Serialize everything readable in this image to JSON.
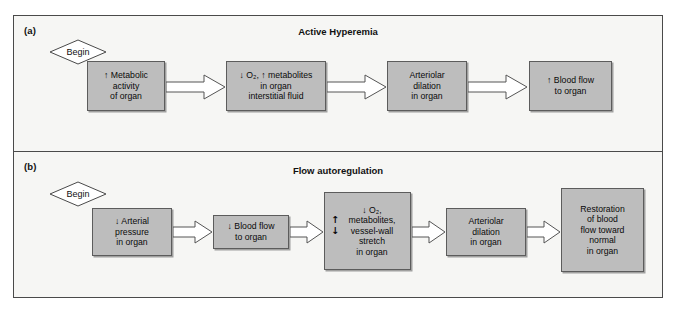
{
  "figure": {
    "panels": [
      {
        "key": "a",
        "label": "(a)",
        "title": "Active Hyperemia",
        "begin_label": "Begin",
        "steps": [
          {
            "name": "metabolic-activity",
            "lines": [
              "↑ Metabolic",
              "activity",
              "of organ"
            ]
          },
          {
            "name": "o2-metabolites",
            "lines": [
              "↓ O₂, ↑ metabolites",
              "in organ",
              "interstitial fluid"
            ]
          },
          {
            "name": "arteriolar-dilation",
            "lines": [
              "Arteriolar",
              "dilation",
              "in organ"
            ]
          },
          {
            "name": "blood-flow",
            "lines": [
              "↑ Blood flow",
              "to organ"
            ]
          }
        ]
      },
      {
        "key": "b",
        "label": "(b)",
        "title": "Flow autoregulation",
        "begin_label": "Begin",
        "steps": [
          {
            "name": "arterial-pressure",
            "lines": [
              "↓ Arterial",
              "pressure",
              "in organ"
            ]
          },
          {
            "name": "blood-flow-to-organ",
            "lines": [
              "↓ Blood flow",
              "to organ"
            ]
          },
          {
            "name": "o2-metabolites-stretch",
            "marks": [
              "↑",
              "↓"
            ],
            "lines": [
              "↓ O₂,",
              "metabolites,",
              "vessel-wall",
              "stretch",
              "in organ"
            ]
          },
          {
            "name": "arteriolar-dilation",
            "lines": [
              "Arteriolar",
              "dilation",
              "in organ"
            ]
          },
          {
            "name": "restoration-of-flow",
            "lines": [
              "Restoration",
              "of blood",
              "flow toward",
              "normal",
              "in organ"
            ]
          }
        ]
      }
    ],
    "colors": {
      "box_fill": "#bdbdbd",
      "box_border": "#5c5c5c",
      "frame_border": "#4a4a4a",
      "background": "#f6f6f4",
      "arrow_fill": "#ffffff",
      "arrow_stroke": "#555555"
    }
  }
}
